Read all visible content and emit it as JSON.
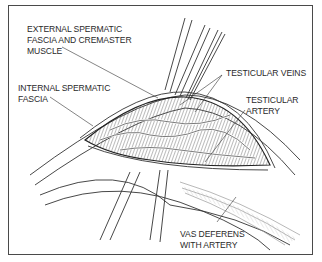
{
  "figure": {
    "type": "anatomical surgical illustration",
    "labels": {
      "external_fascia": "EXTERNAL SPERMATIC\nFASCIA AND CREMASTER\nMUSCLE",
      "internal_fascia": "INTERNAL SPERMATIC\nFASCIA",
      "testicular_veins": "TESTICULAR VEINS",
      "testicular_artery": "TESTICULAR\nARTERY",
      "vas_deferens": "VAS DEFERENS\nWITH ARTERY"
    },
    "colors": {
      "line": "#333333",
      "hatch": "#666666",
      "frame": "#4a4a4a",
      "background": "#ffffff"
    }
  }
}
